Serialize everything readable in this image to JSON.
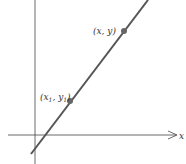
{
  "diagram": {
    "title": "",
    "axes": {
      "x_label": "x",
      "color": "#444444"
    },
    "line": {
      "color": "#555555"
    },
    "points": [
      {
        "label": "(x, y)"
      },
      {
        "label_prefix": "(x",
        "label_sub1": "1",
        "label_mid": ", y",
        "label_sub2": "1",
        "label_suffix": ")"
      }
    ],
    "point_color": "#666666"
  }
}
